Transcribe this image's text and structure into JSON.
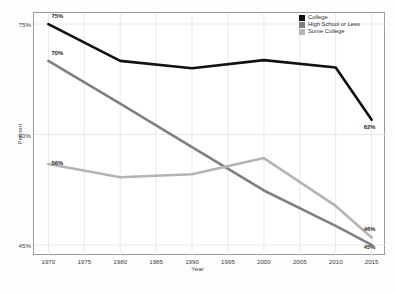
{
  "chart_data": {
    "type": "line",
    "title": "",
    "xlabel": "Year",
    "ylabel": "Percent",
    "x": [
      1970,
      1980,
      1990,
      2000,
      2010,
      2015
    ],
    "xticks": [
      "1970",
      "1975",
      "1980",
      "1985",
      "1990",
      "1995",
      "2000",
      "2005",
      "2010",
      "2015"
    ],
    "xtick_values": [
      1970,
      1975,
      1980,
      1985,
      1990,
      1995,
      2000,
      2005,
      2010,
      2015
    ],
    "yticks": [
      "75%",
      "60%",
      "45%"
    ],
    "ytick_values": [
      75,
      60,
      45
    ],
    "xlim": [
      1968,
      2017
    ],
    "ylim": [
      43.5,
      76.5
    ],
    "grid": true,
    "legend_position": "top-right",
    "series": [
      {
        "name": "College",
        "color": "#111111",
        "values": [
          75,
          70,
          69,
          70.1,
          69.1,
          62
        ]
      },
      {
        "name": "High School or Less",
        "color": "#808080",
        "values": [
          70,
          64.2,
          58.3,
          52.4,
          47.6,
          45
        ]
      },
      {
        "name": "Some College",
        "color": "#b4b4b4",
        "values": [
          56,
          54.2,
          54.6,
          56.8,
          50.3,
          46
        ]
      }
    ],
    "annotations": [
      {
        "series": "College",
        "x": 1970,
        "value": 75,
        "text": "75%"
      },
      {
        "series": "College",
        "x": 2015,
        "value": 62,
        "text": "62%"
      },
      {
        "series": "High School or Less",
        "x": 1970,
        "value": 70,
        "text": "70%"
      },
      {
        "series": "High School or Less",
        "x": 2015,
        "value": 45,
        "text": "45%"
      },
      {
        "series": "Some College",
        "x": 1970,
        "value": 56,
        "text": "56%"
      },
      {
        "series": "Some College",
        "x": 2015,
        "value": 46,
        "text": "46%"
      }
    ]
  },
  "legend": {
    "items": [
      {
        "label": "College",
        "color": "#111111"
      },
      {
        "label": "High School or Less",
        "color": "#808080"
      },
      {
        "label": "Some College",
        "color": "#b4b4b4"
      }
    ]
  },
  "axes": {
    "x_title": "Year",
    "y_title": "Percent"
  },
  "colors": {
    "grid": "#e8e8e8",
    "frame": "#9a9a9a",
    "background": "#ffffff",
    "text": "#3c3c3c"
  }
}
